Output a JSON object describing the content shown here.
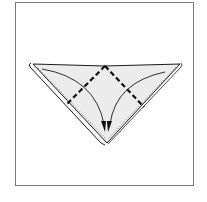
{
  "diagram": {
    "type": "origami-fold-step",
    "colors": {
      "frame_border": "#7a7a7a",
      "paper_fill": "#ececec",
      "outline": "#1a1a1a",
      "fold_line": "#111111",
      "dotted_edge": "#555555",
      "background": "#ffffff"
    },
    "elements": {
      "triangle": {
        "points": [
          [
            31,
            64
          ],
          [
            181,
            64
          ],
          [
            107,
            144
          ]
        ]
      },
      "back_layer": {
        "points": [
          [
            29,
            66
          ],
          [
            101,
            144
          ],
          [
            104,
            146
          ]
        ]
      },
      "dashed_folds": [
        {
          "from": [
            105,
            65
          ],
          "to": [
            67,
            104
          ]
        },
        {
          "from": [
            105,
            65
          ],
          "to": [
            144,
            107
          ]
        }
      ],
      "arrows": [
        {
          "from": [
            42,
            69
          ],
          "to": [
            104,
            130
          ],
          "direction": "down-right"
        },
        {
          "from": [
            165,
            72
          ],
          "to": [
            110,
            130
          ],
          "direction": "down-left"
        }
      ]
    }
  }
}
